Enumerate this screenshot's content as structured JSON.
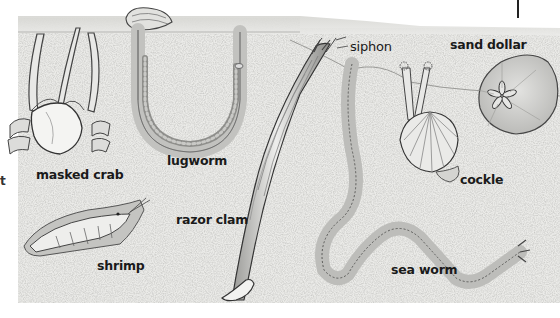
{
  "diagram": {
    "labels": {
      "masked_crab": "masked crab",
      "lugworm": "lugworm",
      "siphon": "siphon",
      "razor_clam": "razor clam",
      "sand_dollar": "sand dollar",
      "cockle": "cockle",
      "shrimp": "shrimp",
      "sea_worm": "sea worm",
      "edge_fragment": "t"
    },
    "colors": {
      "sand": "#e9e9e6",
      "sand_dark": "#cfcfcb",
      "surface": "#dcdcd8",
      "outline": "#3a3a3a",
      "label": "#1a1a1a"
    }
  }
}
